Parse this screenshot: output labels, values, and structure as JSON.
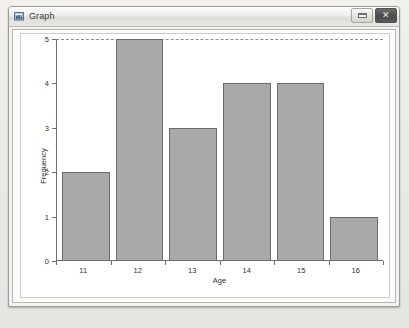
{
  "window": {
    "title": "Graph",
    "icon": "graph-window-icon",
    "buttons": {
      "minimize_label": "",
      "close_label": "✕"
    }
  },
  "chart_data": {
    "type": "bar",
    "title": "",
    "categories": [
      "11",
      "12",
      "13",
      "14",
      "15",
      "16"
    ],
    "values": [
      2,
      5,
      3,
      4,
      4,
      1
    ],
    "xlabel": "Age",
    "ylabel": "Frequency",
    "ylim": [
      0,
      5
    ],
    "yticks": [
      "0",
      "1",
      "2",
      "3",
      "4",
      "5"
    ],
    "grid": false,
    "legend": null,
    "bar_fill": "#a9a9a9",
    "bar_stroke": "#6c6b69",
    "axis_color": "#6f6e6c",
    "plot_background": "#ffffff"
  }
}
